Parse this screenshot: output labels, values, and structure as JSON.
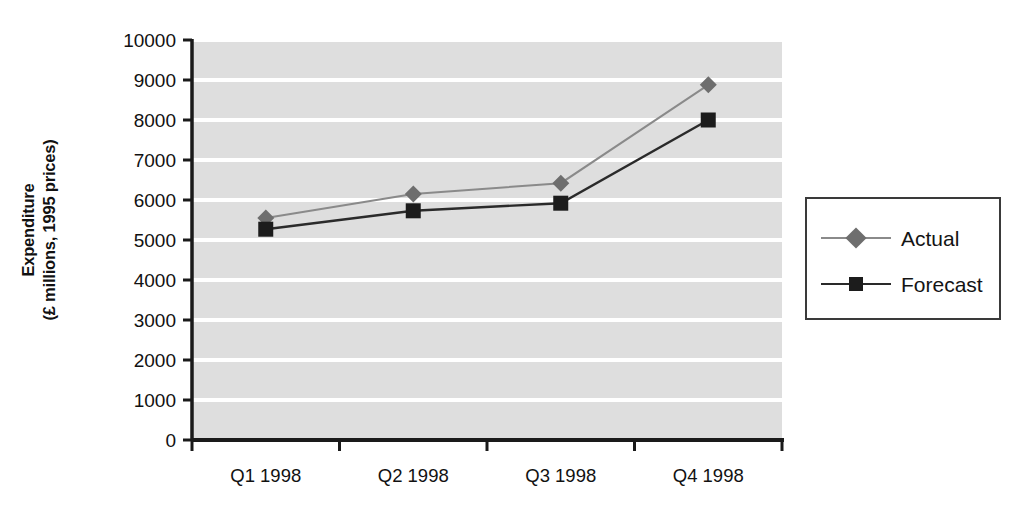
{
  "chart_data": {
    "type": "line",
    "title": "",
    "subtitle": "",
    "xlabel": "",
    "ylabel": "Expenditure\n(£ millions, 1995 prices)",
    "ylabel_line1": "Expenditure",
    "ylabel_line2": "(£ millions, 1995 prices)",
    "categories": [
      "Q1 1998",
      "Q2 1998",
      "Q3 1998",
      "Q4 1998"
    ],
    "series": [
      {
        "name": "Actual",
        "values": [
          5550,
          6150,
          6420,
          8880
        ],
        "marker": "diamond",
        "color": "#6e6e6e"
      },
      {
        "name": "Forecast",
        "values": [
          5270,
          5730,
          5920,
          8000
        ],
        "marker": "square",
        "color": "#1c1c1c"
      }
    ],
    "ylim": [
      0,
      10000
    ],
    "yticks": [
      0,
      1000,
      2000,
      3000,
      4000,
      5000,
      6000,
      7000,
      8000,
      9000,
      10000
    ],
    "ytick_labels": [
      "0",
      "1000",
      "2000",
      "3000",
      "4000",
      "5000",
      "6000",
      "7000",
      "8000",
      "9000",
      "10000"
    ],
    "grid": true,
    "grid_axis": "y",
    "grid_color": "#ffffff",
    "plot_background": "#dedede",
    "axis_color": "#1a1a1a",
    "legend_position": "right",
    "legend_entries": [
      "Actual",
      "Forecast"
    ]
  },
  "legend": {
    "entries": [
      {
        "label": "Actual",
        "marker": "diamond-marker",
        "color": "#6e6e6e"
      },
      {
        "label": "Forecast",
        "marker": "square-marker",
        "color": "#1c1c1c"
      }
    ]
  },
  "axes": {
    "y_title_line1": "Expenditure",
    "y_title_line2": "(£ millions, 1995 prices)",
    "y_ticks": [
      "10000",
      "9000",
      "8000",
      "7000",
      "6000",
      "5000",
      "4000",
      "3000",
      "2000",
      "1000",
      "0"
    ],
    "x_ticks": [
      "Q1 1998",
      "Q2 1998",
      "Q3 1998",
      "Q4 1998"
    ]
  }
}
